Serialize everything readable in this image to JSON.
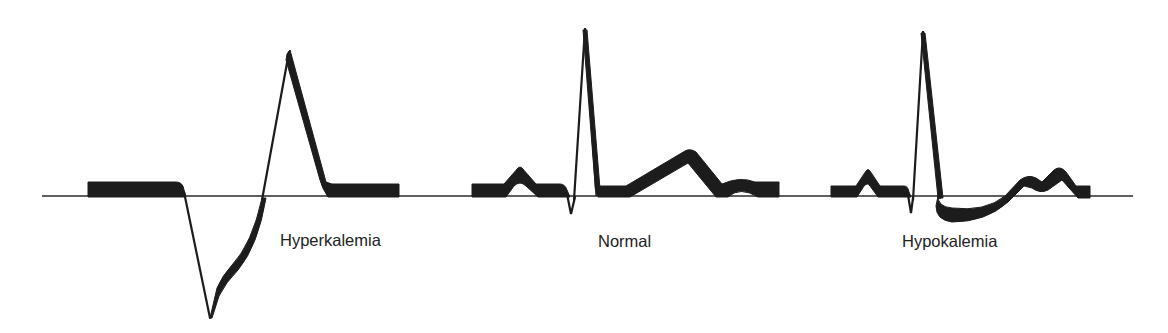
{
  "figure": {
    "colors": {
      "ink": "#1c1c1c",
      "background": "#ffffff"
    },
    "panels": [
      {
        "id": "hyperkalemia",
        "label": "Hyperkalemia",
        "features": [
          "flat absent P wave",
          "wide deep S wave",
          "tall peaked T wave"
        ]
      },
      {
        "id": "normal",
        "label": "Normal",
        "features": [
          "P wave",
          "narrow QRS",
          "broad T wave",
          "small U wave"
        ]
      },
      {
        "id": "hypokalemia",
        "label": "Hypokalemia",
        "features": [
          "P wave",
          "narrow QRS",
          "ST depression",
          "flattened T wave",
          "prominent U wave"
        ]
      }
    ]
  }
}
